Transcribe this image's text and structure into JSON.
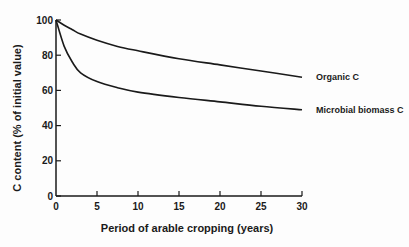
{
  "chart_data": {
    "type": "line",
    "title": "",
    "xlabel": "Period of arable cropping (years)",
    "ylabel": "C content (% of initial value)",
    "xlim": [
      0,
      30
    ],
    "ylim": [
      0,
      100
    ],
    "xticks": [
      0,
      5,
      10,
      15,
      20,
      25,
      30
    ],
    "yticks": [
      0,
      20,
      40,
      60,
      80,
      100
    ],
    "grid": false,
    "legend_position": "inline labels at right end of lines",
    "x": [
      0,
      1,
      2,
      3,
      5,
      7.5,
      10,
      15,
      20,
      25,
      30
    ],
    "series": [
      {
        "name": "Organic C",
        "values": [
          100,
          97,
          94.5,
          92,
          88.5,
          85,
          82.5,
          78,
          74.5,
          71,
          67.5
        ]
      },
      {
        "name": "Microbial biomass C",
        "values": [
          100,
          85,
          76,
          70,
          65,
          61.5,
          59,
          56,
          53.5,
          51,
          49
        ]
      }
    ]
  }
}
